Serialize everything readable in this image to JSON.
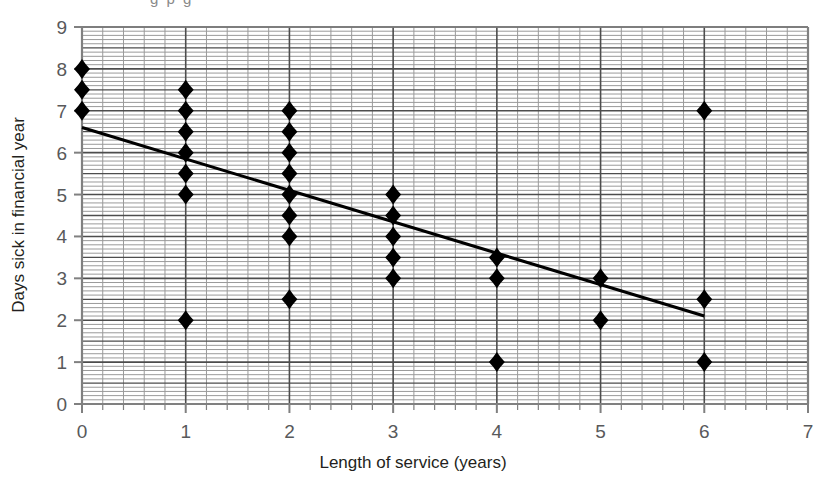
{
  "figure": {
    "cropped_caption_fragment": "g p g",
    "background_color": "#ffffff"
  },
  "chart_data": {
    "type": "scatter",
    "title": "",
    "xlabel": "Length of service (years)",
    "ylabel": "Days sick in financial year",
    "xlim": [
      0,
      7
    ],
    "ylim": [
      0,
      9
    ],
    "xticks": [
      0,
      1,
      2,
      3,
      4,
      5,
      6,
      7
    ],
    "xticklabels": [
      "0",
      "1",
      "2",
      "3",
      "4",
      "5",
      "6",
      "7"
    ],
    "yticks": [
      0,
      1,
      2,
      3,
      4,
      5,
      6,
      7,
      8,
      9
    ],
    "yticklabels": [
      "0",
      "1",
      "2",
      "3",
      "4",
      "5",
      "6",
      "7",
      "8",
      "9"
    ],
    "grid": true,
    "grid_minor_x_step": 0.2,
    "grid_major_x_step": 1.0,
    "grid_minor_y_step": 0.1,
    "grid_major_y_step": 0.5,
    "grid_color": "#9a9a9a",
    "grid_major_color": "#4d4d4d",
    "legend": null,
    "marker": "diamond",
    "marker_color": "#000000",
    "points": [
      {
        "x": 0,
        "y": 8
      },
      {
        "x": 0,
        "y": 7.5
      },
      {
        "x": 0,
        "y": 7
      },
      {
        "x": 1,
        "y": 7.5
      },
      {
        "x": 1,
        "y": 7
      },
      {
        "x": 1,
        "y": 6.5
      },
      {
        "x": 1,
        "y": 6
      },
      {
        "x": 1,
        "y": 5.5
      },
      {
        "x": 1,
        "y": 5
      },
      {
        "x": 1,
        "y": 2
      },
      {
        "x": 2,
        "y": 7
      },
      {
        "x": 2,
        "y": 6.5
      },
      {
        "x": 2,
        "y": 6
      },
      {
        "x": 2,
        "y": 5.5
      },
      {
        "x": 2,
        "y": 5
      },
      {
        "x": 2,
        "y": 4.5
      },
      {
        "x": 2,
        "y": 4
      },
      {
        "x": 2,
        "y": 2.5
      },
      {
        "x": 3,
        "y": 5
      },
      {
        "x": 3,
        "y": 4.5
      },
      {
        "x": 3,
        "y": 4
      },
      {
        "x": 3,
        "y": 3.5
      },
      {
        "x": 3,
        "y": 3
      },
      {
        "x": 4,
        "y": 3.5
      },
      {
        "x": 4,
        "y": 3
      },
      {
        "x": 4,
        "y": 1
      },
      {
        "x": 5,
        "y": 3
      },
      {
        "x": 5,
        "y": 2
      },
      {
        "x": 6,
        "y": 7
      },
      {
        "x": 6,
        "y": 2.5
      },
      {
        "x": 6,
        "y": 1
      }
    ],
    "trend_line": {
      "name": "line of best fit",
      "color": "#000000",
      "x_start": 0,
      "y_start": 6.6,
      "x_end": 6,
      "y_end": 2.1
    }
  }
}
